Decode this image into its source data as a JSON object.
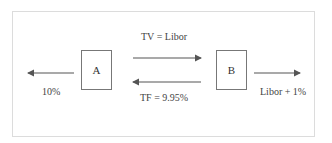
{
  "diagram": {
    "nodes": [
      {
        "id": "A",
        "label": "A"
      },
      {
        "id": "B",
        "label": "B"
      }
    ],
    "edges": [
      {
        "from": "A",
        "to": "B",
        "label": "TV = Libor",
        "direction": "right"
      },
      {
        "from": "B",
        "to": "A",
        "label": "TF = 9.95%",
        "direction": "left"
      },
      {
        "from": "A",
        "to": "outside-left",
        "label": "10%",
        "direction": "left"
      },
      {
        "from": "B",
        "to": "outside-right",
        "label": "Libor + 1%",
        "direction": "right"
      }
    ],
    "labels": {
      "top_arrow": "TV = Libor",
      "bottom_arrow": "TF = 9.95%",
      "left_arrow": "10%",
      "right_arrow": "Libor + 1%"
    },
    "colors": {
      "stroke": "#555555",
      "frame": "#dcdcdc",
      "text": "#444444"
    }
  }
}
